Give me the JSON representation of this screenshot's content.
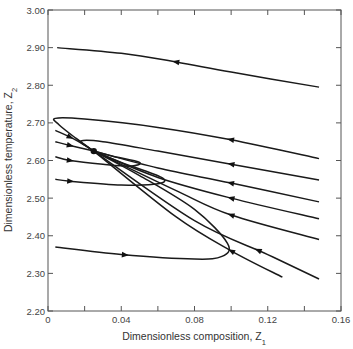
{
  "chart_data": {
    "type": "line",
    "title": "",
    "xlabel": "Dimensionless composition, Z",
    "xlabel_sub": "1",
    "ylabel": "Dimensionless temperature, Z",
    "ylabel_sub": "2",
    "xlim": [
      0,
      0.16
    ],
    "ylim": [
      2.2,
      3.0
    ],
    "grid": false,
    "legend": null,
    "x_ticks": [
      0,
      0.02,
      0.04,
      0.06,
      0.08,
      0.1,
      0.12,
      0.14,
      0.16
    ],
    "x_tick_labels": [
      {
        "value": 0,
        "label": "0"
      },
      {
        "value": 0.04,
        "label": "0.04"
      },
      {
        "value": 0.08,
        "label": "0.08"
      },
      {
        "value": 0.12,
        "label": "0.12"
      },
      {
        "value": 0.16,
        "label": "0.16"
      }
    ],
    "y_ticks": [
      2.2,
      2.3,
      2.4,
      2.5,
      2.6,
      2.7,
      2.8,
      2.9,
      3.0
    ],
    "y_tick_labels": [
      "2.20",
      "2.30",
      "2.40",
      "2.50",
      "2.60",
      "2.70",
      "2.80",
      "2.90",
      "3.00"
    ],
    "saddle_point": {
      "x": 0.025,
      "y": 2.625
    },
    "series": [
      {
        "name": "trajectory-top",
        "points": [
          [
            0.005,
            2.9
          ],
          [
            0.04,
            2.885
          ],
          [
            0.07,
            2.862
          ],
          [
            0.1,
            2.835
          ],
          [
            0.148,
            2.795
          ]
        ],
        "arrow_at": 0.07,
        "direction": "left"
      },
      {
        "name": "trajectory-outer-loop",
        "points": [
          [
            0.148,
            2.605
          ],
          [
            0.1,
            2.655
          ],
          [
            0.06,
            2.688
          ],
          [
            0.02,
            2.71
          ],
          [
            0.004,
            2.712
          ],
          [
            0.006,
            2.695
          ],
          [
            0.015,
            2.66
          ],
          [
            0.025,
            2.625
          ]
        ],
        "arrow_at": 0.1,
        "direction": "left"
      },
      {
        "name": "trajectory-inner-loop",
        "points": [
          [
            0.148,
            2.548
          ],
          [
            0.1,
            2.59
          ],
          [
            0.06,
            2.625
          ],
          [
            0.03,
            2.65
          ],
          [
            0.018,
            2.652
          ],
          [
            0.022,
            2.635
          ],
          [
            0.025,
            2.625
          ]
        ],
        "arrow_at": 0.1,
        "direction": "left"
      },
      {
        "name": "trajectory-mid-1",
        "points": [
          [
            0.148,
            2.49
          ],
          [
            0.1,
            2.54
          ],
          [
            0.06,
            2.58
          ],
          [
            0.025,
            2.625
          ]
        ],
        "arrow_at": 0.1,
        "direction": "left"
      },
      {
        "name": "trajectory-mid-2",
        "points": [
          [
            0.148,
            2.445
          ],
          [
            0.1,
            2.5
          ],
          [
            0.06,
            2.555
          ],
          [
            0.025,
            2.625
          ]
        ],
        "arrow_at": 0.1,
        "direction": "left"
      },
      {
        "name": "trajectory-mid-3",
        "points": [
          [
            0.148,
            2.39
          ],
          [
            0.1,
            2.455
          ],
          [
            0.07,
            2.52
          ],
          [
            0.025,
            2.625
          ]
        ],
        "arrow_at": 0.1,
        "direction": "left"
      },
      {
        "name": "trajectory-lower-right-1",
        "points": [
          [
            0.148,
            2.285
          ],
          [
            0.12,
            2.35
          ],
          [
            0.08,
            2.44
          ],
          [
            0.025,
            2.625
          ]
        ],
        "arrow_at": 0.115,
        "direction": "left"
      },
      {
        "name": "trajectory-lower-right-2",
        "points": [
          [
            0.128,
            2.29
          ],
          [
            0.1,
            2.36
          ],
          [
            0.07,
            2.45
          ],
          [
            0.025,
            2.625
          ]
        ],
        "arrow_at": 0.1,
        "direction": "left"
      },
      {
        "name": "trajectory-left-1",
        "points": [
          [
            0.004,
            2.68
          ],
          [
            0.015,
            2.655
          ],
          [
            0.025,
            2.625
          ]
        ],
        "arrow_at": 0.012,
        "direction": "right"
      },
      {
        "name": "trajectory-left-2",
        "points": [
          [
            0.004,
            2.65
          ],
          [
            0.012,
            2.64
          ],
          [
            0.025,
            2.625
          ]
        ],
        "arrow_at": 0.012,
        "direction": "right"
      },
      {
        "name": "trajectory-left-3",
        "points": [
          [
            0.004,
            2.61
          ],
          [
            0.012,
            2.6
          ],
          [
            0.03,
            2.59
          ],
          [
            0.045,
            2.585
          ],
          [
            0.05,
            2.595
          ],
          [
            0.035,
            2.612
          ],
          [
            0.025,
            2.625
          ]
        ],
        "arrow_at": 0.012,
        "direction": "right"
      },
      {
        "name": "trajectory-left-4",
        "points": [
          [
            0.004,
            2.55
          ],
          [
            0.012,
            2.545
          ],
          [
            0.04,
            2.535
          ],
          [
            0.06,
            2.538
          ],
          [
            0.062,
            2.555
          ],
          [
            0.04,
            2.595
          ],
          [
            0.025,
            2.625
          ]
        ],
        "arrow_at": 0.012,
        "direction": "right"
      },
      {
        "name": "trajectory-bottom",
        "points": [
          [
            0.004,
            2.37
          ],
          [
            0.04,
            2.35
          ],
          [
            0.08,
            2.338
          ],
          [
            0.095,
            2.345
          ],
          [
            0.098,
            2.38
          ],
          [
            0.08,
            2.47
          ],
          [
            0.05,
            2.56
          ],
          [
            0.025,
            2.625
          ]
        ],
        "arrow_at": 0.042,
        "direction": "right"
      }
    ]
  }
}
